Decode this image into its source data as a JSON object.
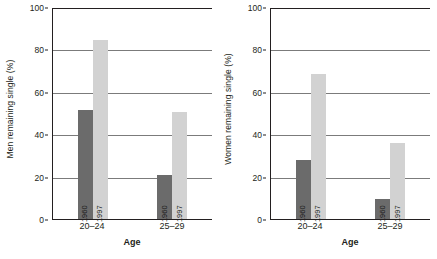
{
  "chart_data": [
    {
      "type": "bar",
      "panel": "left",
      "title": "",
      "categories": [
        "20–24",
        "25–29"
      ],
      "series": [
        {
          "name": "1960",
          "values": [
            52,
            21
          ],
          "color": "#6b6b6b"
        },
        {
          "name": "1997",
          "values": [
            85,
            51
          ],
          "color": "#d2d2d2"
        }
      ],
      "xlabel": "Age",
      "ylabel": "Men remaining single (%)",
      "ylim": [
        0,
        100
      ],
      "yticks": [
        0,
        20,
        40,
        60,
        80,
        100
      ],
      "ytick_labels": [
        "0",
        "20",
        "40",
        "60",
        "80",
        "100"
      ],
      "grid": true,
      "legend": "none",
      "bar_value_labels": [
        "1960",
        "1997",
        "1960",
        "1997"
      ]
    },
    {
      "type": "bar",
      "panel": "right",
      "title": "",
      "categories": [
        "20–24",
        "25–29"
      ],
      "series": [
        {
          "name": "1960",
          "values": [
            28.5,
            10
          ],
          "color": "#6b6b6b"
        },
        {
          "name": "1997",
          "values": [
            69,
            36.5
          ],
          "color": "#d2d2d2"
        }
      ],
      "xlabel": "Age",
      "ylabel": "Women remaining single (%)",
      "ylim": [
        0,
        100
      ],
      "yticks": [
        0,
        20,
        40,
        60,
        80,
        100
      ],
      "ytick_labels": [
        "0",
        "20",
        "40",
        "60",
        "80",
        "100"
      ],
      "grid": true,
      "legend": "none",
      "bar_value_labels": [
        "1960",
        "1997",
        "1960",
        "1997"
      ]
    }
  ],
  "panels": {
    "left": {
      "ylabel": "Men remaining single (%)",
      "xlabel": "Age",
      "yticks": [
        "100",
        "80",
        "60",
        "40",
        "20",
        "0"
      ],
      "categories": [
        "20–24",
        "25–29"
      ],
      "groups": [
        {
          "category": "20–24",
          "bars": [
            {
              "year": "1960",
              "value": 52
            },
            {
              "year": "1997",
              "value": 85
            }
          ]
        },
        {
          "category": "25–29",
          "bars": [
            {
              "year": "1960",
              "value": 21
            },
            {
              "year": "1997",
              "value": 51
            }
          ]
        }
      ]
    },
    "right": {
      "ylabel": "Women remaining single (%)",
      "xlabel": "Age",
      "yticks": [
        "100",
        "80",
        "60",
        "40",
        "20",
        "0"
      ],
      "categories": [
        "20–24",
        "25–29"
      ],
      "groups": [
        {
          "category": "20–24",
          "bars": [
            {
              "year": "1960",
              "value": 28.5
            },
            {
              "year": "1997",
              "value": 69
            }
          ]
        },
        {
          "category": "25–29",
          "bars": [
            {
              "year": "1960",
              "value": 10
            },
            {
              "year": "1997",
              "value": 36.5
            }
          ]
        }
      ]
    }
  },
  "colors": {
    "series_1960": "#6b6b6b",
    "series_1997": "#d2d2d2",
    "gridline": "#7b7b7b",
    "axis": "#231f20",
    "background": "#ffffff"
  }
}
